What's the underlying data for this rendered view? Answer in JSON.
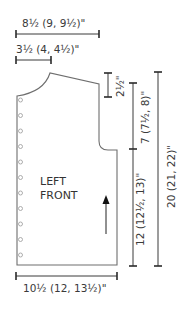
{
  "piece": {
    "label_line1": "LEFT",
    "label_line2": "FRONT",
    "button_count": 11,
    "outline_color": "#6e6e6e"
  },
  "measurements": {
    "shoulder_to_center_width": "8½ (9, 9½)\"",
    "neck_width": "3½ (4, 4½)\"",
    "shoulder_slope_depth": "2½\"",
    "armhole_depth": "7 (7½, 8)\"",
    "side_length_to_armhole": "12 (12½, 13)\"",
    "total_length": "20 (21, 22)\"",
    "bottom_width": "10½ (12, 13½)\""
  },
  "grainline": {
    "direction": "up"
  }
}
